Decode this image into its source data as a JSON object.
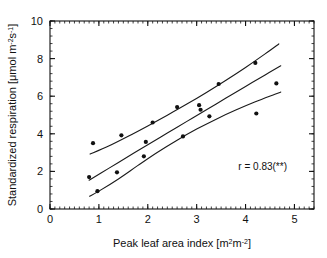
{
  "chart_data": {
    "type": "scatter",
    "title": "",
    "xlabel": "Peak leaf area index [m2m-2]",
    "xlabel_parts": {
      "text": "Peak leaf area index [m",
      "sup1": "2",
      "mid": "m",
      "sup2": "-2",
      "tail": "]"
    },
    "ylabel": "Standardized respiration [umol m-2s-1]",
    "ylabel_parts": {
      "text": "Standardized respiration [μmol m",
      "sup1": "-2",
      "mid": "s",
      "sup2": "-1",
      "tail": "]"
    },
    "xlim": [
      0,
      5.4
    ],
    "ylim": [
      0,
      10
    ],
    "xticks": [
      0,
      1,
      2,
      3,
      4,
      5
    ],
    "xticklabels": [
      "0",
      "1",
      "2",
      "3",
      "4",
      "5"
    ],
    "yticks": [
      0,
      2,
      4,
      6,
      8,
      10
    ],
    "yticklabels": [
      "0",
      "2",
      "4",
      "6",
      "8",
      "10"
    ],
    "x_minor_step": 0.1,
    "y_minor_step": 0.4,
    "grid": false,
    "legend": null,
    "frame": "box",
    "tick_direction": "in",
    "annotations": [
      {
        "name": "correlation",
        "text": "r = 0.83(**)",
        "x": 4.35,
        "y": 2.05
      }
    ],
    "points": [
      {
        "x": 0.8,
        "y": 1.7
      },
      {
        "x": 0.88,
        "y": 3.5
      },
      {
        "x": 0.97,
        "y": 0.95
      },
      {
        "x": 1.37,
        "y": 1.95
      },
      {
        "x": 1.46,
        "y": 3.92
      },
      {
        "x": 1.92,
        "y": 2.8
      },
      {
        "x": 1.96,
        "y": 3.57
      },
      {
        "x": 2.1,
        "y": 4.6
      },
      {
        "x": 2.6,
        "y": 5.42
      },
      {
        "x": 2.72,
        "y": 3.86
      },
      {
        "x": 3.05,
        "y": 5.52
      },
      {
        "x": 3.08,
        "y": 5.28
      },
      {
        "x": 3.26,
        "y": 4.93
      },
      {
        "x": 3.45,
        "y": 6.65
      },
      {
        "x": 4.2,
        "y": 7.77
      },
      {
        "x": 4.22,
        "y": 5.08
      },
      {
        "x": 4.63,
        "y": 6.68
      }
    ],
    "series": [
      {
        "name": "regression-line",
        "type": "line",
        "points": [
          {
            "x": 0.8,
            "y": 1.53
          },
          {
            "x": 1.2,
            "y": 2.16
          },
          {
            "x": 1.6,
            "y": 2.79
          },
          {
            "x": 2.0,
            "y": 3.42
          },
          {
            "x": 2.4,
            "y": 4.04
          },
          {
            "x": 2.8,
            "y": 4.66
          },
          {
            "x": 3.2,
            "y": 5.28
          },
          {
            "x": 3.6,
            "y": 5.9
          },
          {
            "x": 4.0,
            "y": 6.52
          },
          {
            "x": 4.4,
            "y": 7.13
          },
          {
            "x": 4.72,
            "y": 7.62
          }
        ]
      },
      {
        "name": "upper-confidence-band",
        "type": "line",
        "points": [
          {
            "x": 0.82,
            "y": 2.92
          },
          {
            "x": 1.2,
            "y": 3.35
          },
          {
            "x": 1.6,
            "y": 3.87
          },
          {
            "x": 2.0,
            "y": 4.42
          },
          {
            "x": 2.4,
            "y": 4.99
          },
          {
            "x": 2.8,
            "y": 5.58
          },
          {
            "x": 3.2,
            "y": 6.2
          },
          {
            "x": 3.6,
            "y": 6.85
          },
          {
            "x": 4.0,
            "y": 7.53
          },
          {
            "x": 4.4,
            "y": 8.25
          },
          {
            "x": 4.68,
            "y": 8.78
          }
        ]
      },
      {
        "name": "lower-confidence-band",
        "type": "line",
        "points": [
          {
            "x": 0.81,
            "y": 0.68
          },
          {
            "x": 1.0,
            "y": 0.95
          },
          {
            "x": 1.4,
            "y": 1.6
          },
          {
            "x": 1.8,
            "y": 2.32
          },
          {
            "x": 2.2,
            "y": 3.02
          },
          {
            "x": 2.6,
            "y": 3.66
          },
          {
            "x": 3.0,
            "y": 4.25
          },
          {
            "x": 3.4,
            "y": 4.78
          },
          {
            "x": 3.8,
            "y": 5.26
          },
          {
            "x": 4.2,
            "y": 5.7
          },
          {
            "x": 4.6,
            "y": 6.1
          },
          {
            "x": 4.72,
            "y": 6.22
          }
        ]
      }
    ]
  }
}
